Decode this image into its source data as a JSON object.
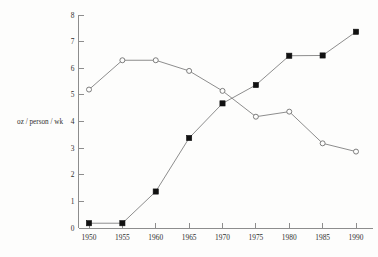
{
  "chart_data": {
    "type": "line",
    "title": "",
    "subtitle": "",
    "xlabel": "",
    "ylabel": "oz / person / wk",
    "categories": [
      "1950",
      "1955",
      "1960",
      "1965",
      "1970",
      "1975",
      "1980",
      "1985",
      "1990"
    ],
    "x": [
      1950,
      1955,
      1960,
      1965,
      1970,
      1975,
      1980,
      1985,
      1990
    ],
    "xlim": [
      1950,
      1990
    ],
    "ylim": [
      0,
      8
    ],
    "yticks": [
      "0",
      "1",
      "2",
      "3",
      "4",
      "5",
      "6",
      "7",
      "8"
    ],
    "ytick_values": [
      0,
      1,
      2,
      3,
      4,
      5,
      6,
      7,
      8
    ],
    "grid": false,
    "legend": "none",
    "series": [
      {
        "name": "open-circle-series",
        "marker": "open-circle",
        "values": [
          5.2,
          6.3,
          6.3,
          5.9,
          5.15,
          4.18,
          4.37,
          3.18,
          2.87
        ]
      },
      {
        "name": "filled-square-series",
        "marker": "filled-square",
        "values": [
          0.18,
          0.18,
          1.37,
          3.38,
          4.68,
          5.37,
          6.47,
          6.48,
          7.37
        ]
      }
    ],
    "colors": {
      "axis": "#8d8d8d",
      "line": "#808080",
      "filled_marker": "#111111",
      "open_marker_fill": "#fdfdfc",
      "background": "#fdfdfc",
      "text": "#2f2f2f"
    }
  }
}
